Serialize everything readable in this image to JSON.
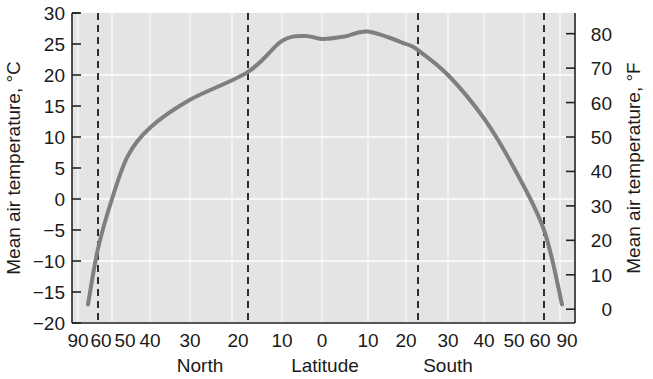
{
  "chart_data": {
    "type": "line",
    "title": "",
    "xlabel": "Latitude",
    "xlabel_sides": {
      "left": "North",
      "right": "South"
    },
    "ylabel": "Mean air temperature, °C",
    "ylabel_right": "Mean air temperature, °F",
    "ylim": [
      -20,
      30
    ],
    "ylim_right": [
      0,
      80
    ],
    "grid": true,
    "x_tick_labels": [
      "90",
      "60",
      "50",
      "40",
      "30",
      "20",
      "10",
      "0",
      "10",
      "20",
      "30",
      "40",
      "50",
      "60",
      "90"
    ],
    "x_tick_pos": [
      78,
      101,
      125,
      150,
      190,
      238,
      282,
      322,
      368,
      406,
      448,
      484,
      514,
      540,
      567
    ],
    "y_ticks": [
      30,
      25,
      20,
      15,
      10,
      5,
      0,
      -5,
      -10,
      -15,
      -20
    ],
    "y_tick_labels": [
      "30",
      "25",
      "20",
      "15",
      "10",
      "5",
      "0",
      "−5",
      "−10",
      "−15",
      "−20"
    ],
    "y_ticks_right": [
      80,
      70,
      60,
      50,
      40,
      30,
      20,
      10,
      0
    ],
    "dashed_lines": [
      {
        "label": "Arctic Circle",
        "latitude": "66.5N",
        "x": 98
      },
      {
        "label": "Tropic of Cancer",
        "latitude": "23.5N",
        "x": 248
      },
      {
        "label": "Tropic of Capricorn",
        "latitude": "23.5S",
        "x": 418
      },
      {
        "label": "Antarctic Circle",
        "latitude": "66.5S",
        "x": 544
      }
    ],
    "series": [
      {
        "name": "Mean air temperature",
        "x": [
          "~80N",
          "66.5N",
          "~60N",
          "~50N",
          "40N",
          "30N",
          "23.5N",
          "10N",
          "5N",
          "0",
          "5S",
          "10S",
          "20S",
          "23.5S",
          "30S",
          "40S",
          "50S",
          "66.5S",
          "~80S"
        ],
        "px": [
          88,
          98,
          112,
          128,
          150,
          190,
          248,
          282,
          305,
          322,
          345,
          368,
          406,
          418,
          448,
          484,
          514,
          544,
          562
        ],
        "values": [
          -17,
          -8,
          0,
          7,
          11.5,
          16,
          20.5,
          25.5,
          26.3,
          25.8,
          26.2,
          27,
          25,
          24,
          20,
          13,
          5,
          -5,
          -17
        ]
      }
    ],
    "colors": {
      "background": "#e4e4e4",
      "curve": "#7f7f7f",
      "grid": "#ffffff",
      "axis": "#222222"
    }
  }
}
